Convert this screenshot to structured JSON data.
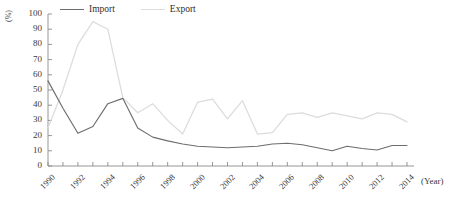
{
  "legend": {
    "position": "top-center",
    "entries": [
      {
        "label": "Import",
        "color": "#6d6d6d"
      },
      {
        "label": "Export",
        "color": "#dcdcdc"
      }
    ]
  },
  "axes": {
    "ylabel": "(%)",
    "xlabel": "(Year)",
    "ytick_labels": [
      "100",
      "90",
      "80",
      "70",
      "60",
      "50",
      "40",
      "30",
      "20",
      "10",
      "0"
    ],
    "xtick_labels": [
      "1990",
      "1992",
      "1994",
      "1996",
      "1998",
      "2000",
      "2002",
      "2004",
      "2006",
      "2008",
      "2010",
      "2012",
      "2014"
    ]
  },
  "chart_data": {
    "type": "line",
    "title": "",
    "xlabel": "(Year)",
    "ylabel": "(%)",
    "xlim": [
      1990,
      2014
    ],
    "ylim": [
      0,
      100
    ],
    "ytick_step": 10,
    "xtick_step": 1,
    "xtick_label_step": 2,
    "grid": false,
    "legend_position": "top-center",
    "x": [
      1990,
      1991,
      1992,
      1993,
      1994,
      1995,
      1996,
      1997,
      1998,
      1999,
      2000,
      2001,
      2002,
      2003,
      2004,
      2005,
      2006,
      2007,
      2008,
      2009,
      2010,
      2011,
      2012,
      2013,
      2014
    ],
    "series": [
      {
        "name": "Import",
        "color": "#6d6d6d",
        "values": [
          56,
          38,
          21.5,
          26,
          41,
          44.5,
          25,
          19,
          16.5,
          14.5,
          13,
          12.5,
          12,
          12.5,
          13,
          14.5,
          15,
          14,
          12,
          10,
          13,
          11.5,
          10.5,
          13.5,
          13.5
        ]
      },
      {
        "name": "Export",
        "color": "#dcdcdc",
        "values": [
          25,
          50,
          80,
          95,
          90,
          45,
          35,
          41,
          30,
          21,
          42,
          44,
          31,
          43,
          21,
          22,
          34,
          35,
          32,
          35,
          33,
          31,
          35,
          34,
          29
        ]
      }
    ]
  }
}
